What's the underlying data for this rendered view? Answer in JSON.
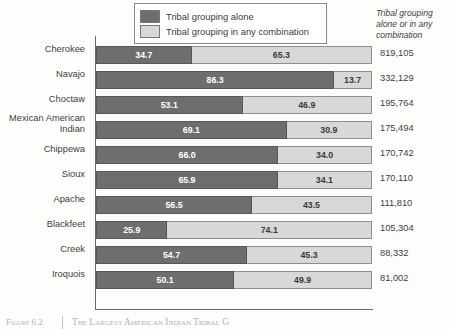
{
  "legend": {
    "items": [
      {
        "key": "alone",
        "label": "Tribal grouping alone",
        "color": "#6e6e6e"
      },
      {
        "key": "combination",
        "label": "Tribal grouping in any combination",
        "color": "#d8d8d8"
      }
    ]
  },
  "right_column_header": "Tribal grouping alone or in any combination",
  "caption": {
    "figure_label": "Figure 6.2",
    "title": "The Largest American Indian Tribal G"
  },
  "chart_data": {
    "type": "bar",
    "orientation": "horizontal",
    "stacked": true,
    "stack_total": 100,
    "title": "",
    "subtitle": "",
    "xlabel": "",
    "ylabel": "",
    "xlim": [
      0,
      100
    ],
    "grid": false,
    "legend_position": "top-center",
    "value_unit": "percent",
    "categories": [
      "Cherokee",
      "Navajo",
      "Choctaw",
      "Mexican American Indian",
      "Chippewa",
      "Sioux",
      "Apache",
      "Blackfeet",
      "Creek",
      "Iroquois"
    ],
    "series": [
      {
        "name": "Tribal grouping alone",
        "color": "#6e6e6e",
        "values": [
          34.7,
          86.3,
          53.1,
          69.1,
          66.0,
          65.9,
          56.5,
          25.9,
          54.7,
          50.1
        ]
      },
      {
        "name": "Tribal grouping in any combination",
        "color": "#d8d8d8",
        "values": [
          65.3,
          13.7,
          46.9,
          30.9,
          34.0,
          34.1,
          43.5,
          74.1,
          45.3,
          49.9
        ]
      }
    ],
    "annotations": {
      "totals_label": "Tribal grouping alone or in any combination",
      "totals": [
        "819,105",
        "332,129",
        "195,764",
        "175,494",
        "170,742",
        "170,110",
        "111,810",
        "105,304",
        "88,332",
        "81,002"
      ]
    }
  }
}
